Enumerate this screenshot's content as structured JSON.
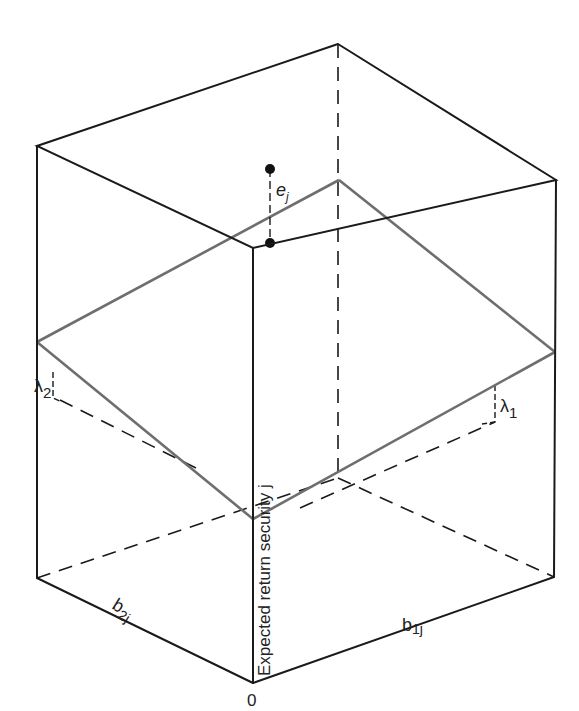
{
  "figure": {
    "type": "3d-box-plane-diagram",
    "labels": {
      "vertical_axis": "Expected return security j",
      "origin": "0",
      "axis_b2": "b",
      "axis_b2_sub": "2j",
      "axis_b1": "b",
      "axis_b1_sub": "1j",
      "error_term": "e",
      "error_term_sub": "j",
      "lambda_1": "λ",
      "lambda_1_sub": "1",
      "lambda_2": "λ",
      "lambda_2_sub": "2"
    },
    "colors": {
      "edge": "#1a1a1a",
      "plane": "#6e6e6e",
      "background": "#ffffff"
    }
  }
}
